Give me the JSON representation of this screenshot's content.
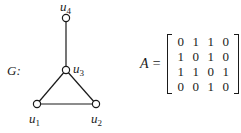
{
  "graph": {
    "name": "G:",
    "nodes": [
      {
        "id": "u1",
        "base": "u",
        "sub": "1",
        "x": 37,
        "y": 104
      },
      {
        "id": "u2",
        "base": "u",
        "sub": "2",
        "x": 96,
        "y": 104
      },
      {
        "id": "u3",
        "base": "u",
        "sub": "3",
        "x": 66,
        "y": 70
      },
      {
        "id": "u4",
        "base": "u",
        "sub": "4",
        "x": 66,
        "y": 18
      }
    ],
    "edges": [
      [
        "u1",
        "u2"
      ],
      [
        "u1",
        "u3"
      ],
      [
        "u2",
        "u3"
      ],
      [
        "u3",
        "u4"
      ]
    ]
  },
  "matrix": {
    "label": "A =",
    "rows": [
      [
        "0",
        "1",
        "1",
        "0"
      ],
      [
        "1",
        "0",
        "1",
        "0"
      ],
      [
        "1",
        "1",
        "0",
        "1"
      ],
      [
        "0",
        "0",
        "1",
        "0"
      ]
    ]
  }
}
